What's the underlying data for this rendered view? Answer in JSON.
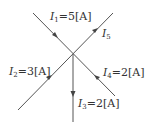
{
  "diagram": {
    "type": "current-junction",
    "node": {
      "x": 73,
      "y": 54
    },
    "branches": [
      {
        "id": "I1",
        "symbol": "I",
        "sub": "1",
        "value": "=5[A]",
        "direction": "into-node",
        "from": [
          33,
          13
        ]
      },
      {
        "id": "I5",
        "symbol": "I",
        "sub": "5",
        "value": "",
        "direction": "out-of-node",
        "to": [
          113,
          13
        ]
      },
      {
        "id": "I2",
        "symbol": "I",
        "sub": "2",
        "value": "=3[A]",
        "direction": "into-node",
        "from": [
          18,
          110
        ]
      },
      {
        "id": "I4",
        "symbol": "I",
        "sub": "4",
        "value": "=2[A]",
        "direction": "into-node",
        "from": [
          115,
          96
        ]
      },
      {
        "id": "I3",
        "symbol": "I",
        "sub": "3",
        "value": "=2[A]",
        "direction": "out-of-node",
        "to": [
          73,
          122
        ]
      }
    ],
    "line_color": "#555555"
  }
}
